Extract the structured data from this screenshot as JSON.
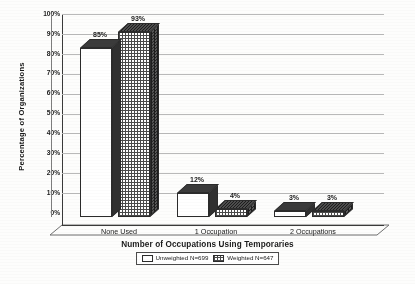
{
  "chart_data": {
    "type": "bar",
    "title": "",
    "xlabel": "Number of Occupations Using Temporaries",
    "ylabel": "Percentage of Organizations",
    "categories": [
      "None Used",
      "1 Occupation",
      "2 Occupations"
    ],
    "series": [
      {
        "name": "Unweighted N=699",
        "values": [
          85,
          12,
          3
        ],
        "fill": "plain"
      },
      {
        "name": "Weighted N=647",
        "values": [
          93,
          4,
          3
        ],
        "fill": "check"
      }
    ],
    "data_labels": [
      [
        "85%",
        "12%",
        "3%"
      ],
      [
        "93%",
        "4%",
        "3%"
      ]
    ],
    "ylim": [
      0,
      100
    ],
    "ytick_labels": [
      "100%",
      "90%",
      "80%",
      "70%",
      "60%",
      "50%",
      "40%",
      "30%",
      "20%",
      "10%",
      "0%"
    ],
    "ytick_values": [
      100,
      90,
      80,
      70,
      60,
      50,
      40,
      30,
      20,
      10,
      0
    ],
    "grid": true,
    "legend_position": "bottom-center",
    "three_d": true,
    "accent_color": "#2b2b2b",
    "grid_color": "#b9b9b9"
  },
  "legend": {
    "items": [
      {
        "label": "Unweighted N=699",
        "swatch": "plain"
      },
      {
        "label": "Weighted N=647",
        "swatch": "check"
      }
    ]
  }
}
